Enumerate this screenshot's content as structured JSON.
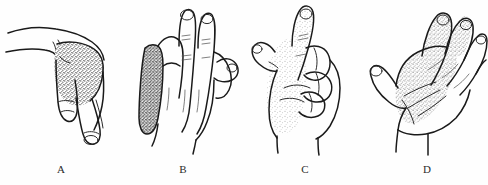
{
  "figure": {
    "background_color": "#fefefe",
    "line_color": "#1a1a1a",
    "panel_count": 4
  },
  "panels": [
    {
      "id": "panel-a",
      "label": "A",
      "subject": "hand",
      "view": "lateral",
      "posture": "wrist-drop",
      "shading_region": "dorsum-of-hand",
      "shading_style": "stipple",
      "shading_color": "#3a3a3a",
      "shading_density": "dense"
    },
    {
      "id": "panel-b",
      "label": "B",
      "subject": "hand",
      "view": "dorsal",
      "posture": "claw-hand",
      "shading_region": "ulnar-border",
      "shading_style": "stipple",
      "shading_color": "#555555",
      "shading_density": "very-dense"
    },
    {
      "id": "panel-c",
      "label": "C",
      "subject": "hand",
      "view": "lateral",
      "posture": "hand-of-benediction",
      "shading_region": "radial-palm-and-thumb",
      "shading_style": "stipple",
      "shading_color": "#9a9a9a",
      "shading_density": "light"
    },
    {
      "id": "panel-d",
      "label": "D",
      "subject": "hand",
      "view": "palmar",
      "posture": "open-palm",
      "shading_region": "thenar-and-central-palm",
      "shading_style": "stipple",
      "shading_color": "#8a8a8a",
      "shading_density": "medium"
    }
  ],
  "labels": {
    "a": "A",
    "b": "B",
    "c": "C",
    "d": "D"
  }
}
